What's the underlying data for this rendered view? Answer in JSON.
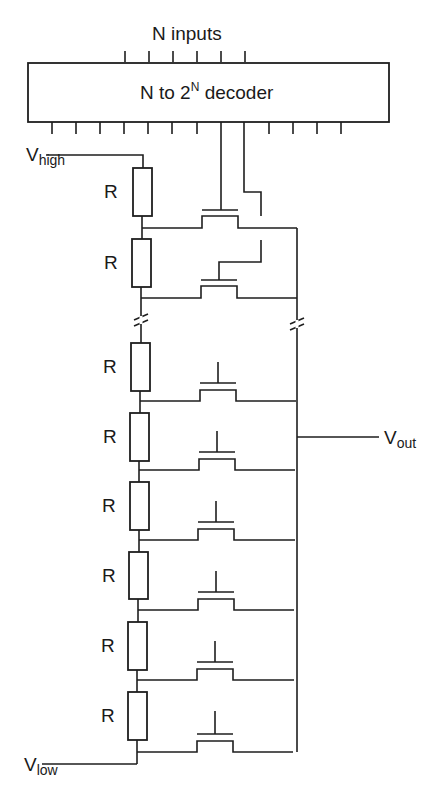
{
  "decoder": {
    "title_prefix": "N to 2",
    "title_sup": "N",
    "title_suffix": " decoder",
    "inputs_label": "N inputs",
    "input_count": 6,
    "output_tick_count": 12
  },
  "supply": {
    "high_main": "V",
    "high_sub": "high",
    "low_main": "V",
    "low_sub": "low"
  },
  "output": {
    "main": "V",
    "sub": "out"
  },
  "resistor_label": "R",
  "resistor_count": 8,
  "transistor_count": 8,
  "break_marks": [
    "left-column",
    "right-rail"
  ],
  "colors": {
    "line": "#1e1e1e",
    "background": "#ffffff"
  }
}
